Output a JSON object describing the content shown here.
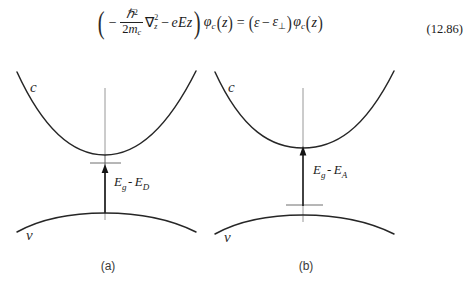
{
  "equation": {
    "number": "(12.86)",
    "latex": "(-\\hbar^2/(2m_c) \\nabla_z^2 - eEz) \\varphi_c(z) = (\\varepsilon - \\varepsilon_\\perp) \\varphi_c(z)",
    "plain_text": "( - ħ² / 2m_c ∇²_z − eEz ) φ_c(z) = ( ε − ε_⊥ ) φ_c(z)",
    "tokens": {
      "open_paren": "(",
      "minus": "−",
      "hbar": "ℏ",
      "hbar_exp": "2",
      "den_2": "2",
      "den_m": "m",
      "den_m_sub": "c",
      "nabla": "∇",
      "nabla_sup": "2",
      "nabla_sub": "z",
      "minus2": "−",
      "eEz": "eEz",
      "close_paren": ")",
      "phi": "φ",
      "phi_sub": "c",
      "arg_open": "(",
      "arg_z": "z",
      "arg_close": ")",
      "equals": "=",
      "rhs_open": "(",
      "epsilon": "ε",
      "rhs_minus": "−",
      "epsilon2": "ε",
      "perp": "⊥",
      "rhs_close": ")",
      "phi2": "φ",
      "phi2_sub": "c"
    }
  },
  "figure": {
    "panels": [
      {
        "id": "panel-a",
        "caption": "(a)",
        "conduction_label": "c",
        "valence_label": "v",
        "gap_label": {
          "full": "Eg - ED",
          "main1": "E",
          "sub1": "g",
          "dash": "-",
          "main2": "E",
          "sub2": "D"
        },
        "impurity_level": "donor",
        "arrow_direction": "up",
        "arrow_from": "valence-band-maximum",
        "arrow_to": "donor-level"
      },
      {
        "id": "panel-b",
        "caption": "(b)",
        "conduction_label": "c",
        "valence_label": "v",
        "gap_label": {
          "full": "Eg - EA",
          "main1": "E",
          "sub1": "g",
          "dash": "-",
          "main2": "E",
          "sub2": "A"
        },
        "impurity_level": "acceptor",
        "arrow_direction": "up",
        "arrow_from": "acceptor-level",
        "arrow_to": "conduction-band-minimum"
      }
    ]
  },
  "colors": {
    "page_background": "#ffffff",
    "curve_stroke": "#262626",
    "axis_stroke": "#8d8d8d",
    "level_stroke": "#5d5d5d",
    "arrow": "#141414",
    "text": "#1b1b1b",
    "caption_text": "#3a3a3a"
  }
}
